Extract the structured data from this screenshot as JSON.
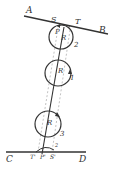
{
  "diagram": {
    "colors": {
      "ink": "#333333",
      "background": "#ffffff",
      "dash": "#888888"
    },
    "lines": {
      "top": {
        "start_label": "A",
        "end_label": "B"
      },
      "bottom": {
        "start_label": "C",
        "end_label": "D"
      }
    },
    "top_contact_labels": {
      "left": "S",
      "right": "T",
      "center": "P"
    },
    "bottom_contact_labels": {
      "left": "T'",
      "center": "P'",
      "right": "S'"
    },
    "circles": [
      {
        "id": "2",
        "number": "2",
        "center_label": "R"
      },
      {
        "id": "1",
        "number": "1",
        "center_label": "R"
      },
      {
        "id": "3",
        "number": "3",
        "center_label": "R"
      }
    ],
    "bottom_small_number": "2"
  }
}
